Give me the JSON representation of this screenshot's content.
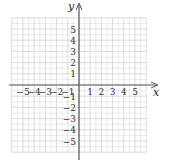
{
  "chart_data": {
    "type": "grid",
    "title": "",
    "xlabel": "x",
    "ylabel": "y",
    "xlim": [
      -6,
      6
    ],
    "ylim": [
      -6,
      6
    ],
    "grid": true,
    "x_tick_labels": [
      "−5",
      "−4",
      "−3",
      "−2",
      "−1",
      "1",
      "2",
      "3",
      "4",
      "5"
    ],
    "x_ticks": [
      -5,
      -4,
      -3,
      -2,
      -1,
      1,
      2,
      3,
      4,
      5
    ],
    "y_tick_labels": [
      "5",
      "4",
      "3",
      "2",
      "1",
      "−1",
      "−2",
      "−3",
      "−4",
      "−5"
    ],
    "y_ticks": [
      5,
      4,
      3,
      2,
      1,
      -1,
      -2,
      -3,
      -4,
      -5
    ],
    "series": []
  },
  "colors": {
    "grid": "#d8d8d8",
    "axis": "#555555",
    "text": "#333333"
  }
}
